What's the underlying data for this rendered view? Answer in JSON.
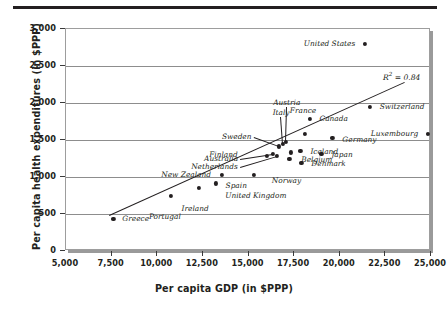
{
  "chart_data": {
    "type": "scatter",
    "title": "",
    "xlabel": "Per capita GDP (in $PPP)",
    "ylabel": "Per capita health expenditures (in $PPP)",
    "xlim": [
      5000,
      25000
    ],
    "ylim": [
      0,
      3000
    ],
    "xticks": [
      "5,000",
      "7,500",
      "10,000",
      "12,500",
      "15,000",
      "17,500",
      "20,000",
      "22,500",
      "25,000"
    ],
    "xtick_values": [
      5000,
      7500,
      10000,
      12500,
      15000,
      17500,
      20000,
      22500,
      25000
    ],
    "yticks": [
      "0",
      "500",
      "1,000",
      "1,500",
      "2,000",
      "2,500",
      "3,000"
    ],
    "ytick_values": [
      0,
      500,
      1000,
      1500,
      2000,
      2500,
      3000
    ],
    "grid": "horizontal",
    "legend": "none",
    "annotation": "R² = 0.84",
    "r_squared": 0.84,
    "trendline": {
      "x_start": 7400,
      "y_start": 470,
      "x_end": 23600,
      "y_end": 2270
    },
    "points": [
      {
        "name": "Greece",
        "x": 7650,
        "y": 420,
        "label_side": "right",
        "leader": false
      },
      {
        "name": "Portugal",
        "x": 10800,
        "y": 730,
        "label_side": "below",
        "leader": false
      },
      {
        "name": "Ireland",
        "x": 12350,
        "y": 840,
        "label_side": "below",
        "leader": false
      },
      {
        "name": "Spain",
        "x": 13250,
        "y": 900,
        "label_side": "right",
        "leader": false
      },
      {
        "name": "New Zealand",
        "x": 13600,
        "y": 1020,
        "label_side": "left",
        "leader": false
      },
      {
        "name": "United Kingdom",
        "x": 15350,
        "y": 1010,
        "label_side": "below",
        "leader": false
      },
      {
        "name": "Finland",
        "x": 16050,
        "y": 1270,
        "label_side": "left",
        "leader": false
      },
      {
        "name": "Australia",
        "x": 16400,
        "y": 1300,
        "label_side": "left",
        "leader": true
      },
      {
        "name": "Netherlands",
        "x": 16600,
        "y": 1270,
        "label_side": "left",
        "leader": true
      },
      {
        "name": "Sweden",
        "x": 16700,
        "y": 1400,
        "label_side": "left",
        "leader": true
      },
      {
        "name": "Italy",
        "x": 16950,
        "y": 1430,
        "label_side": "above",
        "leader": true
      },
      {
        "name": "Austria",
        "x": 17100,
        "y": 1460,
        "label_side": "above",
        "leader": true
      },
      {
        "name": "Belgium",
        "x": 17400,
        "y": 1320,
        "label_side": "right",
        "leader": false
      },
      {
        "name": "Norway",
        "x": 17300,
        "y": 1230,
        "label_side": "below",
        "leader": false
      },
      {
        "name": "Iceland",
        "x": 17900,
        "y": 1340,
        "label_side": "right",
        "leader": false
      },
      {
        "name": "Denmark",
        "x": 17950,
        "y": 1180,
        "label_side": "right",
        "leader": false
      },
      {
        "name": "Japan",
        "x": 19050,
        "y": 1300,
        "label_side": "right",
        "leader": false
      },
      {
        "name": "France",
        "x": 18150,
        "y": 1570,
        "label_side": "above",
        "leader": false
      },
      {
        "name": "Canada",
        "x": 18400,
        "y": 1770,
        "label_side": "right",
        "leader": false
      },
      {
        "name": "Germany",
        "x": 19650,
        "y": 1520,
        "label_side": "right",
        "leader": false
      },
      {
        "name": "Switzerland",
        "x": 21700,
        "y": 1930,
        "label_side": "right",
        "leader": false
      },
      {
        "name": "Luxembourg",
        "x": 24900,
        "y": 1570,
        "label_side": "left",
        "leader": false
      },
      {
        "name": "United States",
        "x": 21450,
        "y": 2780,
        "label_side": "left",
        "leader": false
      }
    ]
  }
}
